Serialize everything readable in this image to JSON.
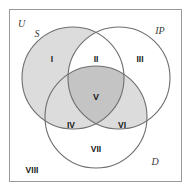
{
  "figure": {
    "type": "venn-diagram-3-set",
    "universe_label": "U",
    "background_color": "#ffffff",
    "frame_color": "#9a9a9a",
    "circle_stroke_color": "#6e6e6e",
    "shade_light": "#dcdcdc",
    "shade_dark": "#c4c4c4",
    "unshaded": "#ffffff"
  },
  "sets": [
    {
      "id": "S",
      "label": "S",
      "position": "upper-left",
      "shaded": true
    },
    {
      "id": "IP",
      "label": "IP",
      "position": "upper-right",
      "shaded": false
    },
    {
      "id": "D",
      "label": "D",
      "position": "bottom-center",
      "shaded": false
    }
  ],
  "regions": [
    {
      "id": "I",
      "label": "I",
      "membership": "S only",
      "shaded": true,
      "fill": "#dcdcdc"
    },
    {
      "id": "II",
      "label": "II",
      "membership": "S and IP",
      "shaded": false,
      "fill": "#ffffff"
    },
    {
      "id": "III",
      "label": "III",
      "membership": "IP only",
      "shaded": false,
      "fill": "#ffffff"
    },
    {
      "id": "IV",
      "label": "IV",
      "membership": "S and D",
      "shaded": true,
      "fill": "#dcdcdc"
    },
    {
      "id": "V",
      "label": "V",
      "membership": "S and IP and D",
      "shaded": true,
      "fill": "#c4c4c4"
    },
    {
      "id": "VI",
      "label": "VI",
      "membership": "IP and D",
      "shaded": true,
      "fill": "#dcdcdc"
    },
    {
      "id": "VII",
      "label": "VII",
      "membership": "D only",
      "shaded": false,
      "fill": "#ffffff"
    },
    {
      "id": "VIII",
      "label": "VIII",
      "membership": "outside all",
      "shaded": false,
      "fill": "#ffffff"
    }
  ]
}
